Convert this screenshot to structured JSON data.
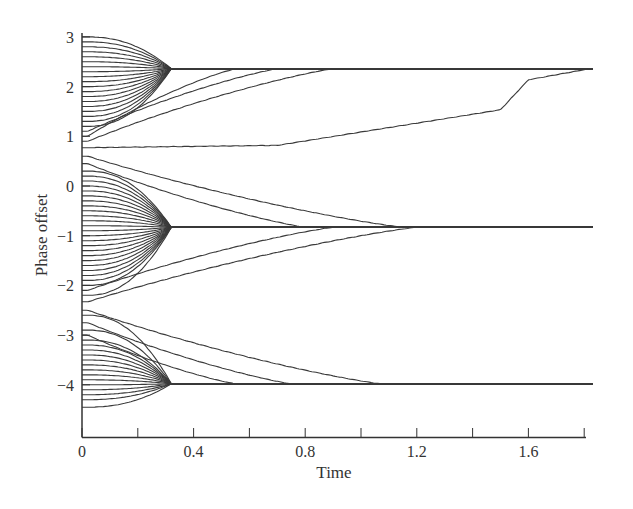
{
  "chart_data": {
    "type": "line",
    "title": "",
    "xlabel": "Time",
    "ylabel": "Phase offset",
    "xlim": [
      0,
      1.83
    ],
    "ylim": [
      -4.9,
      3.05
    ],
    "grid": false,
    "legend": null,
    "x_ticks": [
      0,
      0.2,
      0.4,
      0.6,
      0.8,
      1.0,
      1.2,
      1.4,
      1.6,
      1.8
    ],
    "x_tick_labels": [
      "0",
      "",
      "0.4",
      "",
      "0.8",
      "",
      "1.2",
      "",
      "1.6",
      ""
    ],
    "y_ticks": [
      3,
      2,
      1,
      0,
      -1,
      -2,
      -3,
      -4
    ],
    "y_tick_labels": [
      "3",
      "2",
      "1",
      "0",
      "−1",
      "−2",
      "−3",
      "−4"
    ],
    "clusters": [
      {
        "name": "upper cluster",
        "converged_value": 2.36,
        "initial_values": [
          3.0,
          2.9,
          2.8,
          2.7,
          2.6,
          2.5,
          2.4,
          2.3,
          2.2,
          2.1,
          2.0,
          1.9,
          1.8,
          1.7,
          1.6,
          1.5,
          1.4,
          1.3,
          1.2,
          1.1,
          1.0,
          0.9
        ],
        "sync_time": 0.32,
        "slow_trajectories": [
          {
            "start": 1.1,
            "converge_time": 0.7
          },
          {
            "start": 1.0,
            "converge_time": 0.55
          },
          {
            "start": 0.9,
            "converge_time": 0.9
          },
          {
            "start": 0.77,
            "converge_time": 1.82,
            "note": "remains near 0.8 until ~0.7, rises to ~1.5 by 1.0, jumps near 1.55, reaches 2.36 at ~1.8"
          }
        ]
      },
      {
        "name": "middle cluster",
        "converged_value": -0.83,
        "initial_values": [
          0.6,
          0.5,
          0.4,
          0.3,
          0.2,
          0.1,
          0.0,
          -0.1,
          -0.2,
          -0.3,
          -0.4,
          -0.5,
          -0.6,
          -0.7,
          -0.8,
          -0.9,
          -1.0,
          -1.1,
          -1.2,
          -1.3,
          -1.4,
          -1.5,
          -1.6,
          -1.7,
          -1.8,
          -1.9,
          -2.0,
          -2.1,
          -2.2,
          -2.33
        ],
        "sync_time": 0.32,
        "slow_trajectories": [
          {
            "start": 0.6,
            "converge_time": 1.15
          },
          {
            "start": 0.45,
            "converge_time": 0.8
          },
          {
            "start": -2.1,
            "converge_time": 0.9
          },
          {
            "start": -2.33,
            "converge_time": 1.2
          }
        ]
      },
      {
        "name": "lower cluster",
        "converged_value": -3.98,
        "initial_values": [
          -2.5,
          -2.6,
          -2.7,
          -2.8,
          -2.9,
          -3.0,
          -3.1,
          -3.2,
          -3.3,
          -3.4,
          -3.5,
          -3.6,
          -3.7,
          -3.8,
          -3.9,
          -4.0,
          -4.1,
          -4.2,
          -4.3,
          -4.45
        ],
        "sync_time": 0.32,
        "slow_trajectories": [
          {
            "start": -2.5,
            "converge_time": 1.07
          },
          {
            "start": -2.75,
            "converge_time": 0.75
          },
          {
            "start": -3.0,
            "converge_time": 0.55
          }
        ]
      }
    ],
    "annotations": []
  }
}
